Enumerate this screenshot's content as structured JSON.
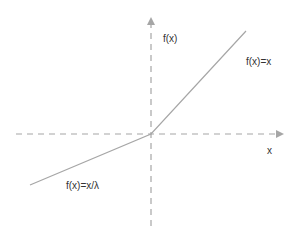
{
  "diagram": {
    "axes": {
      "x_label": "x",
      "y_label": "f(x)",
      "style": "dashed",
      "color": "#a6a6a6"
    },
    "curve": {
      "color": "#a6a6a6",
      "segments": [
        {
          "label": "f(x)=x/λ",
          "domain": "x < 0"
        },
        {
          "label": "f(x)=x",
          "domain": "x ≥ 0"
        }
      ]
    }
  }
}
